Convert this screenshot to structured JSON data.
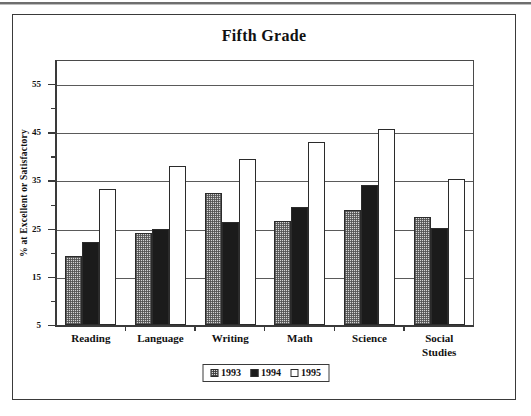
{
  "chart_data": {
    "type": "bar",
    "title": "Fifth Grade",
    "xlabel": "",
    "ylabel": "% at Excellent or Satisfactory",
    "ylim": [
      5,
      60
    ],
    "ytick_labels": [
      "55",
      "45",
      "35",
      "25",
      "15",
      "5"
    ],
    "ytick_values": [
      55,
      45,
      35,
      25,
      15,
      5
    ],
    "minor_ytick_values": [
      50,
      40,
      30,
      20,
      10
    ],
    "grid": "horizontal",
    "legend_position": "bottom-center",
    "categories": [
      "Reading",
      "Language",
      "Writing",
      "Math",
      "Science",
      "Social Studies"
    ],
    "series": [
      {
        "name": "1993",
        "fill": "hatched-gray",
        "values": [
          19.4,
          24.0,
          32.4,
          26.6,
          28.9,
          27.4
        ]
      },
      {
        "name": "1994",
        "fill": "solid-black",
        "values": [
          22.2,
          25.0,
          26.3,
          29.5,
          34.1,
          25.2
        ]
      },
      {
        "name": "1995",
        "fill": "white",
        "values": [
          33.3,
          38.1,
          39.5,
          42.9,
          45.6,
          35.3
        ]
      }
    ]
  },
  "legend": {
    "items": [
      {
        "label": "1993"
      },
      {
        "label": "1994"
      },
      {
        "label": "1995"
      }
    ]
  },
  "axis": {
    "y_title": "% at Excellent or Satisfactory"
  },
  "categories_display": [
    {
      "line1": "Reading",
      "line2": ""
    },
    {
      "line1": "Language",
      "line2": ""
    },
    {
      "line1": "Writing",
      "line2": ""
    },
    {
      "line1": "Math",
      "line2": ""
    },
    {
      "line1": "Science",
      "line2": ""
    },
    {
      "line1": "Social",
      "line2": "Studies"
    }
  ],
  "colors": {
    "frame": "#3a3a3a",
    "grid": "#5a5a5a",
    "series_1993": "#d4d4d4",
    "series_1994": "#1b1b1b",
    "series_1995": "#ffffff"
  }
}
